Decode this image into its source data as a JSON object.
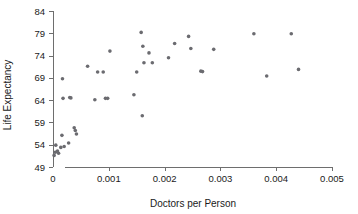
{
  "chart_data": {
    "type": "scatter",
    "title": "",
    "xlabel": "Doctors per Person",
    "ylabel": "Life Expectancy",
    "xlim": [
      0,
      0.005
    ],
    "ylim": [
      49,
      84
    ],
    "xticks": [
      0,
      0.001,
      0.002,
      0.003,
      0.004,
      0.005
    ],
    "xtick_labels": [
      "0",
      "0.001",
      "0.002",
      "0.003",
      "0.004",
      "0.005"
    ],
    "yticks": [
      49,
      54,
      59,
      64,
      69,
      74,
      79,
      84
    ],
    "ytick_labels": [
      "49",
      "54",
      "59",
      "64",
      "69",
      "74",
      "79",
      "84"
    ],
    "grid": false,
    "legend": null,
    "marker": "dot",
    "marker_color": "#6b6b70",
    "points": [
      {
        "x": 2e-05,
        "y": 51.6
      },
      {
        "x": 4e-05,
        "y": 52.3
      },
      {
        "x": 5e-05,
        "y": 53.9
      },
      {
        "x": 8e-05,
        "y": 52.6
      },
      {
        "x": 0.0001,
        "y": 52.1
      },
      {
        "x": 0.00014,
        "y": 53.4
      },
      {
        "x": 0.00016,
        "y": 56.1
      },
      {
        "x": 0.00017,
        "y": 68.8
      },
      {
        "x": 0.00018,
        "y": 64.4
      },
      {
        "x": 0.0002,
        "y": 53.6
      },
      {
        "x": 0.00028,
        "y": 54.4
      },
      {
        "x": 0.0003,
        "y": 64.6
      },
      {
        "x": 0.00032,
        "y": 64.5
      },
      {
        "x": 0.00038,
        "y": 57.8
      },
      {
        "x": 0.0004,
        "y": 57.2
      },
      {
        "x": 0.00042,
        "y": 56.4
      },
      {
        "x": 0.00062,
        "y": 71.6
      },
      {
        "x": 0.00075,
        "y": 64.1
      },
      {
        "x": 0.0008,
        "y": 70.3
      },
      {
        "x": 0.0009,
        "y": 70.3
      },
      {
        "x": 0.00094,
        "y": 64.4
      },
      {
        "x": 0.00098,
        "y": 64.4
      },
      {
        "x": 0.00102,
        "y": 75.0
      },
      {
        "x": 0.00145,
        "y": 65.2
      },
      {
        "x": 0.0015,
        "y": 70.3
      },
      {
        "x": 0.00158,
        "y": 79.2
      },
      {
        "x": 0.0016,
        "y": 60.5
      },
      {
        "x": 0.00161,
        "y": 76.1
      },
      {
        "x": 0.00163,
        "y": 72.4
      },
      {
        "x": 0.00172,
        "y": 74.6
      },
      {
        "x": 0.00178,
        "y": 72.4
      },
      {
        "x": 0.00207,
        "y": 73.5
      },
      {
        "x": 0.00218,
        "y": 76.7
      },
      {
        "x": 0.00243,
        "y": 78.3
      },
      {
        "x": 0.00247,
        "y": 75.6
      },
      {
        "x": 0.00265,
        "y": 70.5
      },
      {
        "x": 0.00268,
        "y": 70.4
      },
      {
        "x": 0.00288,
        "y": 75.4
      },
      {
        "x": 0.0036,
        "y": 78.9
      },
      {
        "x": 0.00383,
        "y": 69.4
      },
      {
        "x": 0.00427,
        "y": 78.9
      },
      {
        "x": 0.0044,
        "y": 70.9
      }
    ]
  }
}
